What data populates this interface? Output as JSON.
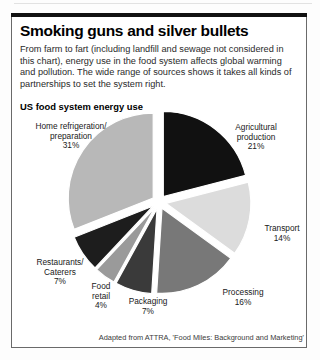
{
  "article": {
    "headline": "Smoking guns and silver bullets",
    "standfirst": "From farm to fart (including landfill and sewage not considered in this chart), energy use in the food system affects global warming and pollution. The wide range of sources shows it takes all kinds of partnerships to set the system right.",
    "source_note": "Adapted from ATTRA, 'Food Miles: Background and Marketing'"
  },
  "chart_data": {
    "type": "pie",
    "title": "US food system energy use",
    "exploded": true,
    "units": "percent",
    "categories": [
      "Agricultural production",
      "Transport",
      "Processing",
      "Packaging",
      "Food retail",
      "Restaurants/Caterers",
      "Home refrigeration/preparation"
    ],
    "values": [
      21,
      14,
      16,
      7,
      4,
      7,
      31
    ],
    "colors": [
      "#111111",
      "#dcdcdc",
      "#787878",
      "#3a3a3a",
      "#9a9a9a",
      "#1d1d1d",
      "#b8b8b8"
    ],
    "slices": [
      {
        "label": "Agricultural production",
        "label_line1": "Agricultural",
        "label_line2": "production",
        "value": 21,
        "value_label": "21%",
        "color": "#111111"
      },
      {
        "label": "Transport",
        "label_line1": "Transport",
        "label_line2": "",
        "value": 14,
        "value_label": "14%",
        "color": "#dcdcdc"
      },
      {
        "label": "Processing",
        "label_line1": "Processing",
        "label_line2": "",
        "value": 16,
        "value_label": "16%",
        "color": "#787878"
      },
      {
        "label": "Packaging",
        "label_line1": "Packaging",
        "label_line2": "",
        "value": 7,
        "value_label": "7%",
        "color": "#3a3a3a"
      },
      {
        "label": "Food retail",
        "label_line1": "Food",
        "label_line2": "retail",
        "value": 4,
        "value_label": "4%",
        "color": "#9a9a9a"
      },
      {
        "label": "Restaurants/Caterers",
        "label_line1": "Restaurants/",
        "label_line2": "Caterers",
        "value": 7,
        "value_label": "7%",
        "color": "#1d1d1d"
      },
      {
        "label": "Home refrigeration/preparation",
        "label_line1": "Home refrigeration/",
        "label_line2": "preparation",
        "value": 31,
        "value_label": "31%",
        "color": "#b8b8b8"
      }
    ],
    "legend": "none",
    "grid": false
  },
  "labels": {
    "home": "Home refrigeration/\npreparation\n31%",
    "agricultural": "Agricultural\nproduction\n21%",
    "transport": "Transport\n14%",
    "processing": "Processing\n16%",
    "packaging": "Packaging\n7%",
    "retail": "Food\nretail\n4%",
    "restaurants": "Restaurants/\nCaterers\n7%"
  }
}
